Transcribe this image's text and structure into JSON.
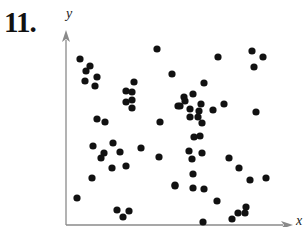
{
  "problem": {
    "number": "11."
  },
  "chart_data": {
    "type": "scatter",
    "title": "",
    "xlabel": "x",
    "ylabel": "y",
    "grid": false,
    "legend": null,
    "ticks": "none",
    "units": "pixel offsets from origin (no numeric scale shown)",
    "xlim": [
      0,
      224
    ],
    "ylim": [
      0,
      190
    ],
    "points": [
      [
        14,
        166
      ],
      [
        24,
        159
      ],
      [
        20,
        154
      ],
      [
        31,
        148
      ],
      [
        19,
        144
      ],
      [
        29,
        139
      ],
      [
        91,
        176
      ],
      [
        106,
        151
      ],
      [
        68,
        143
      ],
      [
        60,
        134
      ],
      [
        66,
        133
      ],
      [
        60,
        123
      ],
      [
        66,
        125
      ],
      [
        66,
        117
      ],
      [
        31,
        106
      ],
      [
        39,
        103
      ],
      [
        94,
        103
      ],
      [
        112,
        119
      ],
      [
        152,
        168
      ],
      [
        186,
        174
      ],
      [
        197,
        168
      ],
      [
        188,
        158
      ],
      [
        138,
        142
      ],
      [
        127,
        131
      ],
      [
        118,
        128
      ],
      [
        119,
        124
      ],
      [
        114,
        119
      ],
      [
        124,
        116
      ],
      [
        135,
        121
      ],
      [
        133,
        114
      ],
      [
        124,
        108
      ],
      [
        132,
        108
      ],
      [
        136,
        102
      ],
      [
        147,
        115
      ],
      [
        158,
        121
      ],
      [
        190,
        113
      ],
      [
        134,
        89
      ],
      [
        128,
        88
      ],
      [
        123,
        74
      ],
      [
        136,
        72
      ],
      [
        126,
        66
      ],
      [
        127,
        51
      ],
      [
        163,
        67
      ],
      [
        173,
        57
      ],
      [
        184,
        45
      ],
      [
        200,
        47
      ],
      [
        109,
        40
      ],
      [
        127,
        37
      ],
      [
        138,
        36
      ],
      [
        151,
        24
      ],
      [
        180,
        18
      ],
      [
        179,
        12
      ],
      [
        172,
        12
      ],
      [
        166,
        6
      ],
      [
        137,
        3
      ],
      [
        27,
        79
      ],
      [
        47,
        82
      ],
      [
        38,
        72
      ],
      [
        35,
        67
      ],
      [
        54,
        73
      ],
      [
        75,
        77
      ],
      [
        93,
        68
      ],
      [
        46,
        57
      ],
      [
        60,
        59
      ],
      [
        26,
        47
      ],
      [
        109,
        39
      ],
      [
        11,
        27
      ],
      [
        51,
        15
      ],
      [
        63,
        14
      ],
      [
        57,
        8
      ]
    ]
  },
  "style": {
    "dot_color": "#111111",
    "axis_color": "#888888",
    "dot_radius": 3.6
  }
}
